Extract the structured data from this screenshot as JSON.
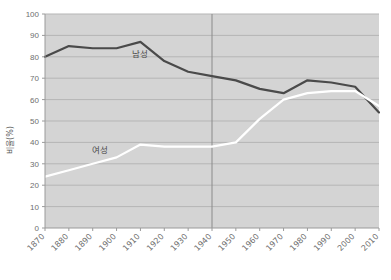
{
  "chart_data": {
    "type": "line",
    "title": "",
    "xlabel": "",
    "ylabel": "비율(%)",
    "ylim": [
      0,
      100
    ],
    "ytick_step": 10,
    "grid": true,
    "legend_position": "inline-annotation",
    "x": [
      1870,
      1880,
      1890,
      1900,
      1910,
      1920,
      1930,
      1940,
      1950,
      1960,
      1970,
      1980,
      1990,
      2000,
      2010
    ],
    "xticklabels": [
      "1870",
      "1880",
      "1890",
      "1900",
      "1910",
      "1920",
      "1930",
      "1940",
      "1950",
      "1960",
      "1970",
      "1980",
      "1990",
      "2000",
      "2010"
    ],
    "yticklabels": [
      "0",
      "10",
      "20",
      "30",
      "40",
      "50",
      "60",
      "70",
      "80",
      "90",
      "100"
    ],
    "yticks": [
      0,
      10,
      20,
      30,
      40,
      50,
      60,
      70,
      80,
      90,
      100
    ],
    "series": [
      {
        "name": "남성",
        "color": "#4a4a4a",
        "label_x": 1910,
        "label_y": 80,
        "values": [
          80,
          85,
          84,
          84,
          87,
          78,
          73,
          71,
          69,
          65,
          63,
          69,
          68,
          66,
          54
        ]
      },
      {
        "name": "여성",
        "color": "#ffffff",
        "label_x": 1893,
        "label_y": 35,
        "values": [
          24,
          27,
          30,
          33,
          39,
          38,
          38,
          38,
          40,
          51,
          60,
          63,
          64,
          64,
          57
        ]
      }
    ],
    "annotations": [
      {
        "name": "reference-line-1940",
        "type": "vline",
        "x": 1940,
        "color": "#8a8a8a"
      }
    ],
    "style": {
      "plot_background": "#d4d4d4",
      "page_background": "#ffffff",
      "gridline_color": "#b5b5b5",
      "axis_color": "#9a9a9a",
      "tick_label_color": "#6e6e6e"
    }
  }
}
